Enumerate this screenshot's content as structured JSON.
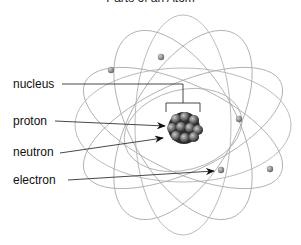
{
  "title": "Parts of an Atom",
  "labels": {
    "nucleus": "nucleus",
    "proton": "proton",
    "neutron": "neutron",
    "electron": "electron"
  },
  "colors": {
    "orbit": "#a9a9a9",
    "leader": "#333333",
    "electron": "#8a8a8a",
    "nucleus_dark": "#3a3a3a",
    "nucleus_light": "#9a9a9a"
  }
}
